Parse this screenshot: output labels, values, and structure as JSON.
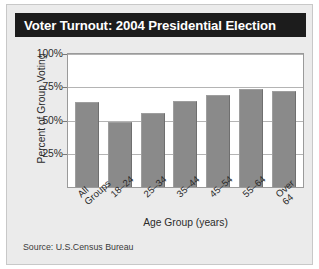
{
  "card": {
    "title": "Voter Turnout: 2004 Presidential Election",
    "source": "Source: U.S.Census Bureau"
  },
  "chart_data": {
    "type": "bar",
    "title": "Voter Turnout: 2004 Presidential Election",
    "xlabel": "Age Group (years)",
    "ylabel": "Percent of Group Voting",
    "categories": [
      "All Groups",
      "18–24",
      "25–34",
      "35–44",
      "45–54",
      "55–64",
      "Over 64"
    ],
    "category_lines": [
      [
        "All",
        "Groups"
      ],
      [
        "18–24",
        ""
      ],
      [
        "25–34",
        ""
      ],
      [
        "35–44",
        ""
      ],
      [
        "45–54",
        ""
      ],
      [
        "55–64",
        ""
      ],
      [
        "Over",
        "64"
      ]
    ],
    "values": [
      64,
      49,
      56,
      64.5,
      69,
      73.5,
      72
    ],
    "ylim": [
      0,
      100
    ],
    "yticks": [
      25,
      50,
      75,
      100
    ],
    "ytick_labels": [
      "25%",
      "50%",
      "75%",
      "100%"
    ],
    "grid": true,
    "legend": "none",
    "bar_color": "#8a8a8a"
  },
  "colors": {
    "title_bar_bg": "#1c1c1c",
    "title_text": "#ffffff",
    "card_bg": "#ebebeb",
    "plot_bg": "#ffffff",
    "grid": "#b4b4b4",
    "bar": "#8a8a8a"
  }
}
